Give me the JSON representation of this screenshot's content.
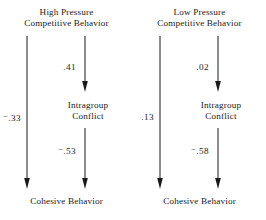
{
  "figure": {
    "type": "path-diagram",
    "panels": [
      {
        "id": "high-pressure",
        "predictor": {
          "line1": "High Pressure",
          "line2": "Competitive Behavior"
        },
        "mediator": {
          "line1": "Intragroup",
          "line2": "Conflict"
        },
        "outcome": {
          "label": "Cohesive Behavior"
        },
        "paths": {
          "direct": {
            "value": ".33",
            "negative": true
          },
          "predictor_to_mediator": {
            "value": ".41",
            "negative": false
          },
          "mediator_to_outcome": {
            "value": ".53",
            "negative": true
          }
        }
      },
      {
        "id": "low-pressure",
        "predictor": {
          "line1": "Low Pressure",
          "line2": "Competitive Behavior"
        },
        "mediator": {
          "line1": "Intragroup",
          "line2": "Conflict"
        },
        "outcome": {
          "label": "Cohesive Behavior"
        },
        "paths": {
          "direct": {
            "value": ".13",
            "negative": false
          },
          "predictor_to_mediator": {
            "value": ".02",
            "negative": false
          },
          "mediator_to_outcome": {
            "value": ".58",
            "negative": true
          }
        }
      }
    ],
    "colors": {
      "ink": "#1a1a1a",
      "background": "#ffffff"
    }
  }
}
